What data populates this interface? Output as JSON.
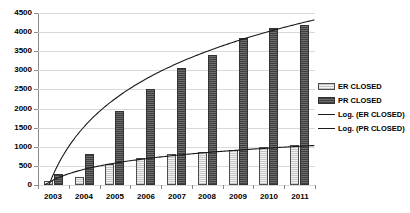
{
  "chart_data": {
    "type": "bar",
    "title": "",
    "xlabel": "",
    "ylabel": "",
    "categories": [
      "2003",
      "2004",
      "2005",
      "2006",
      "2007",
      "2008",
      "2009",
      "2010",
      "2011"
    ],
    "series": [
      {
        "name": "ER CLOSED",
        "type": "bar",
        "color": "#f2f2f2",
        "values": [
          100,
          220,
          550,
          720,
          800,
          870,
          930,
          1000,
          1050
        ]
      },
      {
        "name": "PR CLOSED",
        "type": "bar",
        "color": "#595959",
        "values": [
          300,
          820,
          1950,
          2500,
          3050,
          3400,
          3850,
          4100,
          4200
        ]
      },
      {
        "name": "Log. (ER CLOSED)",
        "type": "line",
        "color": "#1a1a1a",
        "values": [
          120,
          420,
          580,
          690,
          780,
          850,
          910,
          960,
          1010
        ]
      },
      {
        "name": "Log. (PR CLOSED)",
        "type": "line",
        "color": "#1a1a1a",
        "values": [
          180,
          1580,
          2330,
          2830,
          3200,
          3500,
          3760,
          3970,
          4170
        ]
      }
    ],
    "ylim": [
      0,
      4500
    ],
    "ytick_step": 500,
    "yticks": [
      "0",
      "500",
      "1000",
      "1500",
      "2000",
      "2500",
      "3000",
      "3500",
      "4000",
      "4500"
    ],
    "grid": true,
    "legend_position": "right"
  },
  "legend": {
    "items": [
      {
        "label": "ER CLOSED",
        "marker": "swatch-light"
      },
      {
        "label": "PR CLOSED",
        "marker": "swatch-dark"
      },
      {
        "label": "Log. (ER CLOSED)",
        "marker": "line"
      },
      {
        "label": "Log. (PR CLOSED)",
        "marker": "line"
      }
    ]
  }
}
